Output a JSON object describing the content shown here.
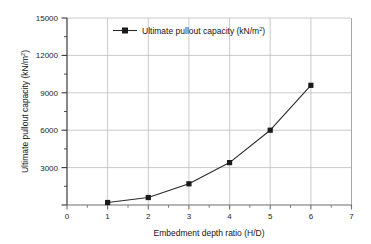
{
  "chart_data": {
    "type": "line",
    "title": "",
    "subtitle": "",
    "xlabel": "Embedment depth ratio (H/D)",
    "ylabel": "Ultimate pullout capacity (kN/m2)",
    "ylabel_main": "Ultimate pullout capacity (kN/m",
    "ylabel_sup": "2",
    "ylabel_tail": ")",
    "xlabel_full": "Embedment depth ratio (H/D)",
    "x": [
      1,
      2,
      3,
      4,
      5,
      6
    ],
    "values": [
      200,
      600,
      1700,
      3400,
      6000,
      9600
    ],
    "series": [
      {
        "name": "Ultimate pullout capacity (kN/m2)",
        "values": [
          200,
          600,
          1700,
          3400,
          6000,
          9600
        ]
      }
    ],
    "xlim": [
      0,
      7
    ],
    "ylim": [
      0,
      15000
    ],
    "xticks": [
      "0",
      "1",
      "2",
      "3",
      "4",
      "5",
      "6",
      "7"
    ],
    "xtick_values": [
      0,
      1,
      2,
      3,
      4,
      5,
      6,
      7
    ],
    "yticks": [
      "3000",
      "6000",
      "9000",
      "12000",
      "15000"
    ],
    "ytick_values": [
      3000,
      6000,
      9000,
      12000,
      15000
    ],
    "yminor_values": [
      1500,
      4500,
      7500,
      10500,
      13500
    ],
    "grid": true,
    "grid_color": "#b6b6b6",
    "legend_position": "top-left-inside",
    "marker": "square",
    "marker_color": "#1a1a1a",
    "line_color": "#2b2b2b",
    "axis_color": "#3a3a3a",
    "background": "#ffffff"
  },
  "legend": {
    "entries": [
      {
        "label_main": "Ultimate pullout capacity (kN/m",
        "label_sup": "2",
        "label_tail": ")",
        "marker": "square-line-marker",
        "color": "#1a1a1a"
      }
    ]
  },
  "axes": {
    "x_title_text": "Embedment depth ratio (H/D)",
    "y_title_main": "Ultimate pullout capacity (kN/m",
    "y_title_sup": "2",
    "y_title_tail": ")"
  }
}
